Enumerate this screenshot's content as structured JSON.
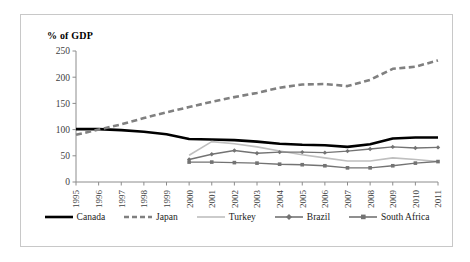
{
  "chart_data": {
    "type": "line",
    "title": "",
    "ylabel": "% of GDP",
    "xlabel": "",
    "ylim": [
      0,
      250
    ],
    "ytick_values": [
      0,
      50,
      100,
      150,
      200,
      250
    ],
    "grid": false,
    "legend_position": "bottom",
    "categories": [
      "1995",
      "1996",
      "1997",
      "1998",
      "1999",
      "2000",
      "2001",
      "2002",
      "2003",
      "2004",
      "2005",
      "2006",
      "2007",
      "2008",
      "2009",
      "2010",
      "2011"
    ],
    "series": [
      {
        "name": "Canada",
        "color": "#000000",
        "style": "solid",
        "width": 2.6,
        "marker": "none",
        "values": [
          101,
          101,
          99,
          96,
          91,
          82,
          81,
          80,
          77,
          73,
          71,
          70,
          67,
          72,
          83,
          85,
          85
        ]
      },
      {
        "name": "Japan",
        "color": "#808080",
        "style": "dashed",
        "width": 2.6,
        "marker": "none",
        "values": [
          90,
          100,
          110,
          122,
          133,
          143,
          153,
          162,
          170,
          180,
          186,
          187,
          183,
          195,
          216,
          220,
          232
        ]
      },
      {
        "name": "Turkey",
        "color": "#bfbfbf",
        "style": "solid",
        "width": 1.6,
        "marker": "none",
        "values": [
          null,
          null,
          null,
          null,
          null,
          51,
          77,
          73,
          67,
          59,
          52,
          46,
          40,
          40,
          46,
          43,
          39
        ]
      },
      {
        "name": "Brazil",
        "color": "#737373",
        "style": "solid",
        "width": 1.4,
        "marker": "diamond",
        "values": [
          null,
          null,
          null,
          null,
          null,
          43,
          53,
          60,
          55,
          57,
          57,
          56,
          59,
          63,
          67,
          65,
          66
        ]
      },
      {
        "name": "South Africa",
        "color": "#737373",
        "style": "solid",
        "width": 1.4,
        "marker": "square",
        "values": [
          null,
          null,
          null,
          null,
          null,
          38,
          38,
          37,
          36,
          34,
          33,
          31,
          27,
          27,
          31,
          36,
          39
        ]
      }
    ]
  },
  "legend": {
    "items": [
      {
        "label": "Canada"
      },
      {
        "label": "Japan"
      },
      {
        "label": "Turkey"
      },
      {
        "label": "Brazil"
      },
      {
        "label": "South Africa"
      }
    ]
  }
}
